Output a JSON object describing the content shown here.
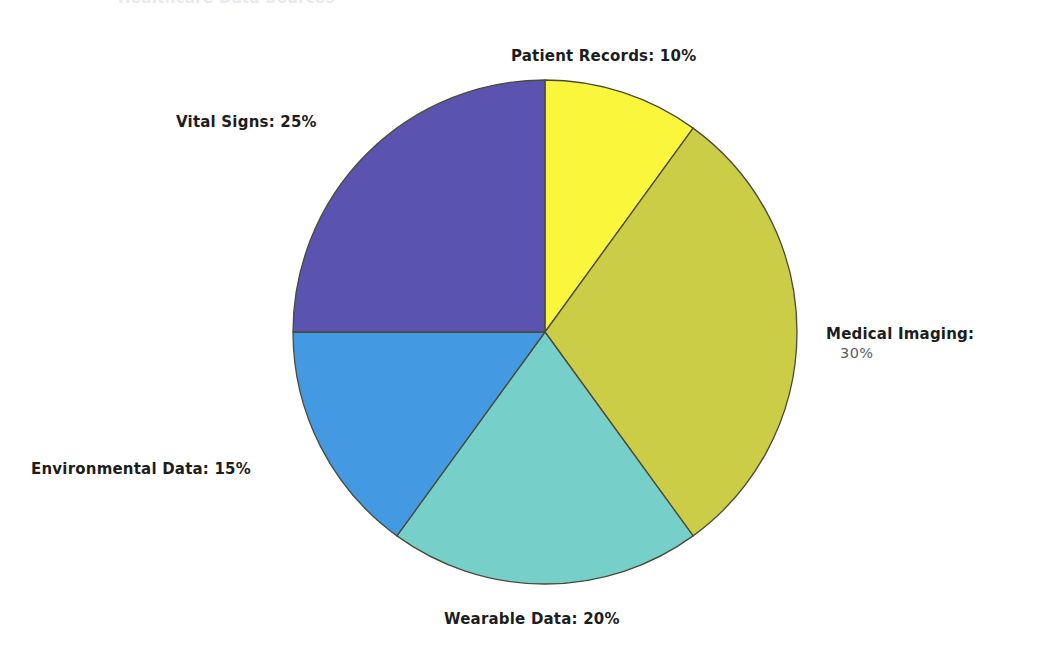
{
  "canvas": {
    "width": 1039,
    "height": 662,
    "background": "#ffffff"
  },
  "top_clipped_text": "Healthcare Data Sources",
  "chart_data": {
    "type": "pie",
    "title": "",
    "categories": [
      "Patient Records",
      "Medical Imaging",
      "Wearable Data",
      "Environmental Data",
      "Vital Signs"
    ],
    "values": [
      10,
      30,
      20,
      15,
      25
    ],
    "value_unit": "%",
    "start_angle_deg": 0,
    "direction": "clockwise",
    "legend": "none",
    "labels_position": "outside",
    "center": {
      "x": 545,
      "y": 332
    },
    "radius": 252,
    "slices": [
      {
        "name": "Patient Records",
        "label": "Patient Records: 10%",
        "value": 10,
        "color": "#faf63c",
        "start_deg": 0,
        "end_deg": 36
      },
      {
        "name": "Medical Imaging",
        "label_line1": "Medical Imaging:",
        "label_line2": "30%",
        "label": "Medical Imaging: 30%",
        "value": 30,
        "color": "#cacd45",
        "start_deg": 36,
        "end_deg": 144
      },
      {
        "name": "Wearable Data",
        "label": "Wearable Data: 20%",
        "value": 20,
        "color": "#76cfc8",
        "start_deg": 144,
        "end_deg": 216
      },
      {
        "name": "Environmental Data",
        "label": "Environmental Data: 15%",
        "value": 15,
        "color": "#4499e3",
        "start_deg": 216,
        "end_deg": 270
      },
      {
        "name": "Vital Signs",
        "label": "Vital Signs: 25%",
        "value": 25,
        "color": "#5a53b0",
        "start_deg": 270,
        "end_deg": 360
      }
    ],
    "slice_outline_color": "#4a4a38"
  }
}
